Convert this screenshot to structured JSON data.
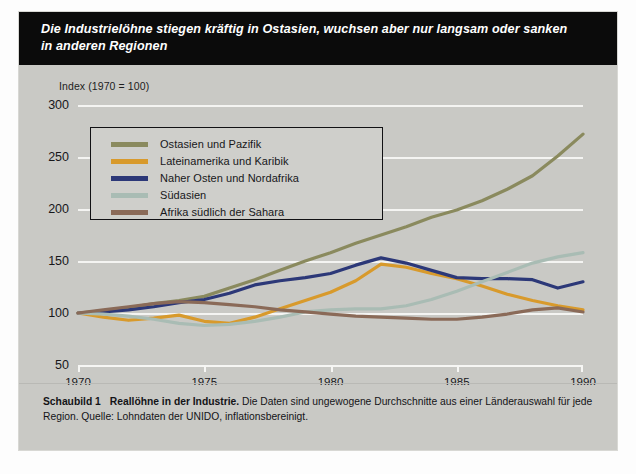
{
  "banner": {
    "title_line1": "Die Industrielöhne stiegen kräftig in Ostasien, wuchsen aber nur langsam oder sanken",
    "title_line2": "in anderen Regionen"
  },
  "caption": {
    "label": "Schaubild 1",
    "subject": "Reallöhne in der Industrie.",
    "text": " Die Daten sind ungewogene Durchschnitte aus einer Länderauswahl für jede Region. Quelle: Lohndaten der UNIDO, inflationsbereinigt."
  },
  "colors": {
    "east_asia": "#8a8a5e",
    "latin_america": "#d89a2c",
    "middle_east": "#2c3878",
    "south_asia": "#a9bcb4",
    "africa": "#8a6a58",
    "background": "#c9c9c5",
    "gridline": "#f4f4f2",
    "banner": "#0b0b0b"
  },
  "chart_data": {
    "type": "line",
    "title": "Die Industrielöhne stiegen kräftig in Ostasien, wuchsen aber nur langsam oder sanken in anderen Regionen",
    "subtitle": "Reallöhne in der Industrie",
    "xlabel": "",
    "ylabel": "Index (1970 = 100)",
    "ylim": [
      50,
      300
    ],
    "xlim": [
      1970,
      1990
    ],
    "yticks": [
      50,
      100,
      150,
      200,
      250,
      300
    ],
    "xticks": [
      1970,
      1975,
      1980,
      1985,
      1990
    ],
    "grid": true,
    "legend_position": "upper-left-inset",
    "x": [
      1970,
      1971,
      1972,
      1973,
      1974,
      1975,
      1976,
      1977,
      1978,
      1979,
      1980,
      1981,
      1982,
      1983,
      1984,
      1985,
      1986,
      1987,
      1988,
      1989,
      1990
    ],
    "series": [
      {
        "name": "Ostasien und Pazifik",
        "color": "#8a8a5e",
        "values": [
          100,
          102,
          105,
          109,
          112,
          116,
          124,
          132,
          141,
          150,
          158,
          167,
          175,
          183,
          192,
          199,
          208,
          219,
          232,
          251,
          272
        ]
      },
      {
        "name": "Lateinamerika und Karibik",
        "color": "#d89a2c",
        "values": [
          100,
          96,
          93,
          95,
          98,
          92,
          90,
          96,
          104,
          112,
          120,
          131,
          147,
          144,
          138,
          133,
          126,
          118,
          112,
          107,
          103
        ]
      },
      {
        "name": "Naher Osten und Nordafrika",
        "color": "#2c3878",
        "values": [
          100,
          101,
          103,
          106,
          110,
          113,
          119,
          127,
          131,
          134,
          138,
          146,
          153,
          148,
          141,
          134,
          133,
          133,
          132,
          124,
          130
        ]
      },
      {
        "name": "Südasien",
        "color": "#a9bcb4",
        "values": [
          100,
          99,
          97,
          94,
          90,
          88,
          89,
          92,
          96,
          101,
          103,
          104,
          104,
          107,
          113,
          121,
          130,
          139,
          148,
          154,
          158
        ]
      },
      {
        "name": "Afrika südlich der Sahara",
        "color": "#8a6a58",
        "values": [
          100,
          103,
          106,
          109,
          111,
          110,
          108,
          106,
          103,
          101,
          99,
          97,
          96,
          95,
          94,
          94,
          96,
          99,
          103,
          105,
          101
        ]
      }
    ]
  }
}
